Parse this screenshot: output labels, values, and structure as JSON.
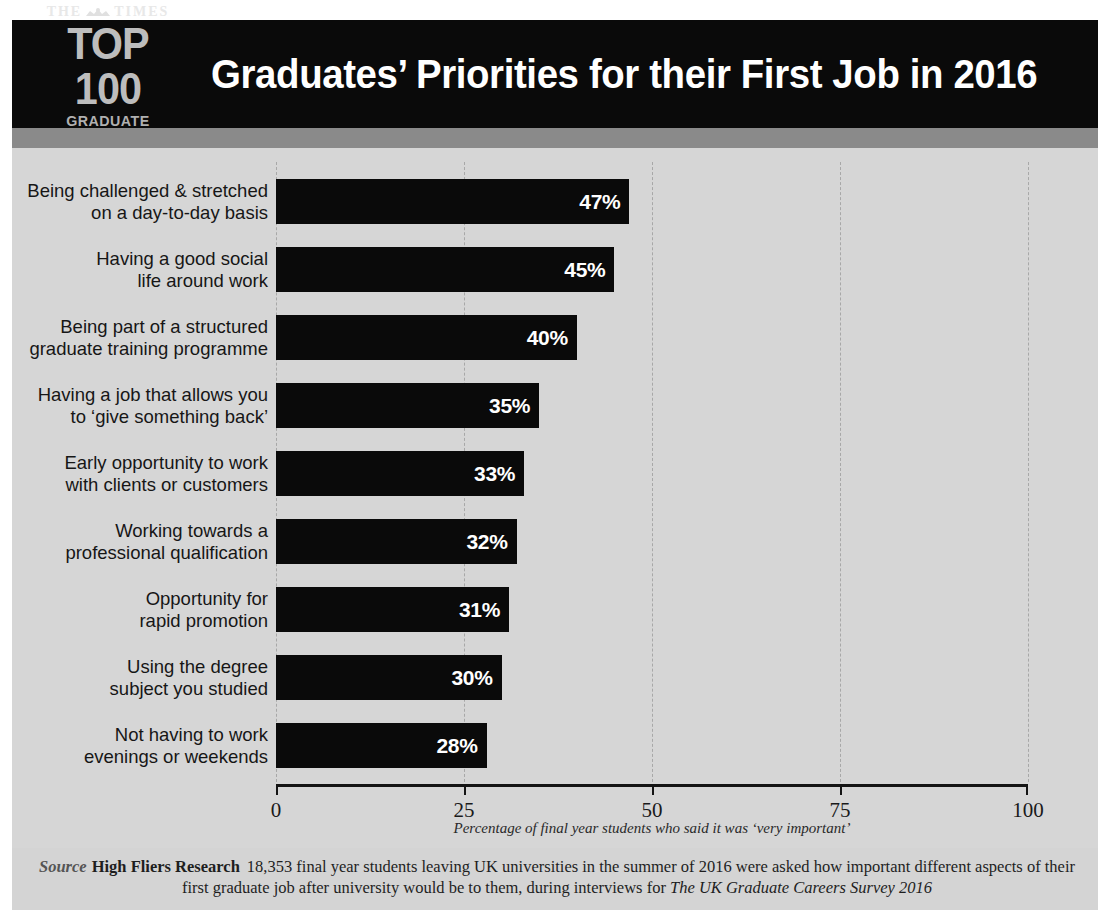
{
  "header": {
    "logo": {
      "masthead": "THE",
      "masthead_suffix": "TIMES",
      "crest_icon": "times-crest-icon",
      "top_line": "TOP 100",
      "bottom_line": "GRADUATE EMPLOYERS"
    },
    "title": "Graduates’ Priorities for their First Job in 2016"
  },
  "source": {
    "label": "Source",
    "organisation": "High Fliers Research",
    "text_before": "18,353 final year students leaving UK universities in the summer of 2016 were asked how important different aspects of their first graduate job after university would be to them, during interviews for",
    "survey": "The UK Graduate Careers Survey 2016"
  },
  "chart_data": {
    "type": "bar",
    "orientation": "horizontal",
    "title": "Graduates’ Priorities for their First Job in 2016",
    "xlabel": "Percentage of final year students who said it was ‘very important’",
    "ylabel": "",
    "xlim": [
      0,
      100
    ],
    "xticks": [
      0,
      25,
      50,
      75,
      100
    ],
    "xtick_labels": [
      "0",
      "25",
      "50",
      "75",
      "100"
    ],
    "grid": true,
    "grid_style": "dashed-vertical",
    "legend": null,
    "bar_color": "#0a0a0a",
    "background_color": "#d6d6d6",
    "value_label_color": "#ffffff",
    "value_suffix": "%",
    "categories": [
      "Being challenged & stretched on a day-to-day basis",
      "Having a good social life around work",
      "Being part of a structured graduate training programme",
      "Having a job that allows you to ‘give something back’",
      "Early opportunity to work with clients or customers",
      "Working towards a professional qualification",
      "Opportunity for rapid promotion",
      "Using the degree subject you studied",
      "Not having to work evenings or weekends"
    ],
    "values": [
      47,
      45,
      40,
      35,
      33,
      32,
      31,
      30,
      28
    ],
    "value_labels": [
      "47%",
      "45%",
      "40%",
      "35%",
      "33%",
      "32%",
      "31%",
      "30%",
      "28%"
    ],
    "category_lines": [
      [
        "Being challenged & stretched",
        "on a day-to-day basis"
      ],
      [
        "Having a good social",
        "life around work"
      ],
      [
        "Being part of a structured",
        "graduate training programme"
      ],
      [
        "Having a job that allows you",
        "to ‘give something back’"
      ],
      [
        "Early opportunity to work",
        "with clients or customers"
      ],
      [
        "Working towards a",
        "professional qualification"
      ],
      [
        "Opportunity for",
        "rapid promotion"
      ],
      [
        "Using the degree",
        "subject you studied"
      ],
      [
        "Not having to work",
        "evenings or weekends"
      ]
    ]
  }
}
